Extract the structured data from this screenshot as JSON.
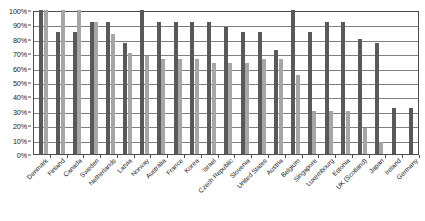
{
  "chart_data": {
    "type": "bar",
    "title": "",
    "xlabel": "",
    "ylabel": "",
    "ylim": [
      0,
      100
    ],
    "ytick_labels": [
      "100%",
      "90%",
      "80%",
      "70%",
      "60%",
      "50%",
      "40%",
      "30%",
      "20%",
      "10%",
      "0%"
    ],
    "ytick_values": [
      100,
      90,
      80,
      70,
      60,
      50,
      40,
      30,
      20,
      10,
      0
    ],
    "grid": true,
    "legend": "none",
    "categories": [
      "Denmark",
      "Finland",
      "Canada",
      "Sweden",
      "Netherlands",
      "Latvia",
      "Norway",
      "Australia",
      "France",
      "Korea",
      "Israel",
      "Czech Republic",
      "Slovenia",
      "United States",
      "Austria",
      "Belgium",
      "Singapore",
      "Luxembourg",
      "Estonia",
      "UK (Scotland)",
      "Japan",
      "Ireland",
      "Germany"
    ],
    "series": [
      {
        "name": "series-1",
        "color": "#595959",
        "values": [
          100,
          85,
          85,
          92,
          92,
          77,
          100,
          92,
          92,
          92,
          92,
          88,
          85,
          85,
          72,
          100,
          85,
          92,
          92,
          80,
          77,
          32,
          32
        ]
      },
      {
        "name": "series-2",
        "color": "#a6a6a6",
        "values": [
          100,
          100,
          100,
          92,
          83,
          70,
          68,
          66,
          66,
          66,
          63,
          63,
          63,
          66,
          66,
          55,
          30,
          30,
          30,
          18,
          8,
          0,
          0
        ]
      }
    ]
  },
  "colors": {
    "series_1": "#595959",
    "series_2": "#a6a6a6",
    "gridline": "#808080",
    "axis": "#4d4d4d",
    "text": "#1a1a1a",
    "background": "#ffffff"
  }
}
